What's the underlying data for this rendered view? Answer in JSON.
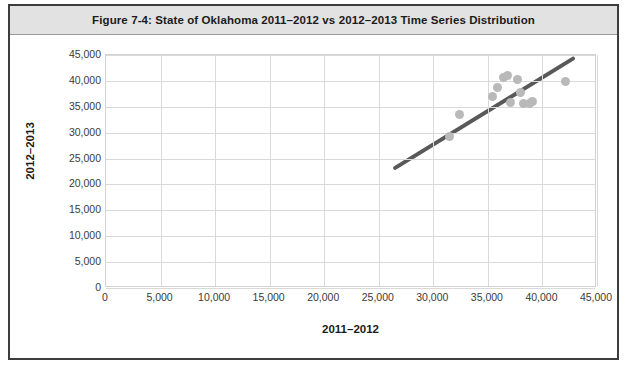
{
  "figure": {
    "caption": "Figure 7-4: State of Oklahoma 2011–2012 vs 2012–2013 Time Series Distribution"
  },
  "colors": {
    "frame_border": "#3d3d3d",
    "caption_background": "#e2e2e2",
    "gridline": "#d9d9d9",
    "point": "#b9b9b9",
    "trendline": "#595959"
  },
  "chart_data": {
    "type": "scatter",
    "title": "Figure 7-4: State of Oklahoma 2011–2012 vs 2012–2013 Time Series Distribution",
    "xlabel": "2011–2012",
    "ylabel": "2012–2013",
    "xlim": [
      0,
      45000
    ],
    "ylim": [
      0,
      45000
    ],
    "grid": true,
    "legend": "none",
    "xticks": [
      "0",
      "5,000",
      "10,000",
      "15,000",
      "20,000",
      "25,000",
      "30,000",
      "35,000",
      "40,000",
      "45,000"
    ],
    "xtick_values": [
      0,
      5000,
      10000,
      15000,
      20000,
      25000,
      30000,
      35000,
      40000,
      45000
    ],
    "yticks": [
      "0",
      "5,000",
      "10,000",
      "15,000",
      "20,000",
      "25,000",
      "30,000",
      "35,000",
      "40,000",
      "45,000"
    ],
    "ytick_values": [
      0,
      5000,
      10000,
      15000,
      20000,
      25000,
      30000,
      35000,
      40000,
      45000
    ],
    "points": [
      {
        "x": 31500,
        "y": 29200
      },
      {
        "x": 32400,
        "y": 33500
      },
      {
        "x": 35400,
        "y": 36900
      },
      {
        "x": 35900,
        "y": 38700
      },
      {
        "x": 36400,
        "y": 40600
      },
      {
        "x": 36800,
        "y": 41000
      },
      {
        "x": 37100,
        "y": 35800
      },
      {
        "x": 37700,
        "y": 40200
      },
      {
        "x": 38000,
        "y": 37800
      },
      {
        "x": 38300,
        "y": 35600
      },
      {
        "x": 38800,
        "y": 35700
      },
      {
        "x": 39100,
        "y": 36100
      },
      {
        "x": 42100,
        "y": 39900
      }
    ],
    "trendline": {
      "type": "linear",
      "x_start": 26500,
      "y_start": 23200,
      "x_end": 42800,
      "y_end": 44300
    }
  }
}
